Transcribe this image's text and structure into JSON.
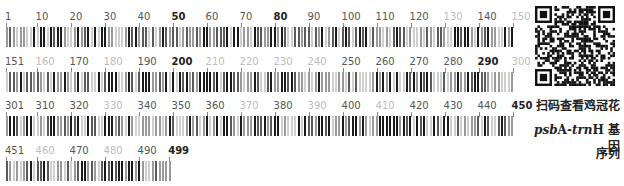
{
  "barcode": {
    "sequence_length": 499,
    "rows": [
      {
        "start": 1,
        "end": 150,
        "ticks": [
          {
            "pos": 1,
            "label": "1",
            "style": "normal"
          },
          {
            "pos": 10,
            "label": "10",
            "style": "normal"
          },
          {
            "pos": 20,
            "label": "20",
            "style": "normal"
          },
          {
            "pos": 30,
            "label": "30",
            "style": "normal"
          },
          {
            "pos": 40,
            "label": "40",
            "style": "normal"
          },
          {
            "pos": 50,
            "label": "50",
            "style": "bold"
          },
          {
            "pos": 60,
            "label": "60",
            "style": "normal"
          },
          {
            "pos": 70,
            "label": "70",
            "style": "normal"
          },
          {
            "pos": 80,
            "label": "80",
            "style": "bold"
          },
          {
            "pos": 90,
            "label": "90",
            "style": "normal"
          },
          {
            "pos": 100,
            "label": "100",
            "style": "normal"
          },
          {
            "pos": 110,
            "label": "110",
            "style": "normal"
          },
          {
            "pos": 120,
            "label": "120",
            "style": "normal"
          },
          {
            "pos": 130,
            "label": "130",
            "style": "dim"
          },
          {
            "pos": 140,
            "label": "140",
            "style": "normal"
          },
          {
            "pos": 150,
            "label": "150",
            "style": "dim"
          }
        ]
      },
      {
        "start": 151,
        "end": 300,
        "ticks": [
          {
            "pos": 151,
            "label": "151",
            "style": "normal"
          },
          {
            "pos": 160,
            "label": "160",
            "style": "dim"
          },
          {
            "pos": 170,
            "label": "170",
            "style": "normal"
          },
          {
            "pos": 180,
            "label": "180",
            "style": "dim"
          },
          {
            "pos": 190,
            "label": "190",
            "style": "normal"
          },
          {
            "pos": 200,
            "label": "200",
            "style": "bold"
          },
          {
            "pos": 210,
            "label": "210",
            "style": "dim"
          },
          {
            "pos": 220,
            "label": "220",
            "style": "dim"
          },
          {
            "pos": 230,
            "label": "230",
            "style": "dim"
          },
          {
            "pos": 240,
            "label": "240",
            "style": "dim"
          },
          {
            "pos": 250,
            "label": "250",
            "style": "normal"
          },
          {
            "pos": 260,
            "label": "260",
            "style": "normal"
          },
          {
            "pos": 270,
            "label": "270",
            "style": "normal"
          },
          {
            "pos": 280,
            "label": "280",
            "style": "normal"
          },
          {
            "pos": 290,
            "label": "290",
            "style": "bold"
          },
          {
            "pos": 300,
            "label": "300",
            "style": "dim"
          }
        ]
      },
      {
        "start": 301,
        "end": 450,
        "ticks": [
          {
            "pos": 301,
            "label": "301",
            "style": "normal"
          },
          {
            "pos": 310,
            "label": "310",
            "style": "normal"
          },
          {
            "pos": 320,
            "label": "320",
            "style": "normal"
          },
          {
            "pos": 330,
            "label": "330",
            "style": "dim"
          },
          {
            "pos": 340,
            "label": "340",
            "style": "normal"
          },
          {
            "pos": 350,
            "label": "350",
            "style": "normal"
          },
          {
            "pos": 360,
            "label": "360",
            "style": "normal"
          },
          {
            "pos": 370,
            "label": "370",
            "style": "dim"
          },
          {
            "pos": 380,
            "label": "380",
            "style": "normal"
          },
          {
            "pos": 390,
            "label": "390",
            "style": "dim"
          },
          {
            "pos": 400,
            "label": "400",
            "style": "normal"
          },
          {
            "pos": 410,
            "label": "410",
            "style": "dim"
          },
          {
            "pos": 420,
            "label": "420",
            "style": "normal"
          },
          {
            "pos": 430,
            "label": "430",
            "style": "normal"
          },
          {
            "pos": 440,
            "label": "440",
            "style": "normal"
          },
          {
            "pos": 450,
            "label": "450",
            "style": "bold"
          }
        ]
      },
      {
        "start": 451,
        "end": 499,
        "ticks": [
          {
            "pos": 451,
            "label": "451",
            "style": "normal"
          },
          {
            "pos": 460,
            "label": "460",
            "style": "dim"
          },
          {
            "pos": 470,
            "label": "470",
            "style": "normal"
          },
          {
            "pos": 480,
            "label": "480",
            "style": "dim"
          },
          {
            "pos": 490,
            "label": "490",
            "style": "normal"
          },
          {
            "pos": 499,
            "label": "499",
            "style": "bold"
          }
        ]
      }
    ],
    "colors": {
      "A": "#1a1a1a",
      "C": "#5a5a5a",
      "G": "#9a9a9a",
      "T": "#cfcfcf"
    },
    "base_width_px": 3.4
  },
  "qr": {
    "alt": "QR code"
  },
  "caption": {
    "line1": "扫码查看鸡冠花",
    "line2_italic_a": "psb",
    "line2_normal_a": "A-",
    "line2_italic_b": "trn",
    "line2_normal_b": "H 基因",
    "line3": "序列"
  }
}
